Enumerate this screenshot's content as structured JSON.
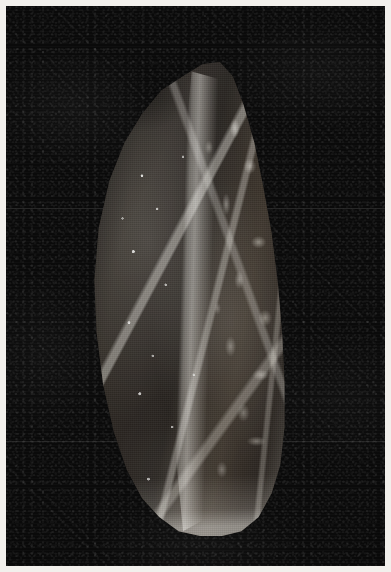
{
  "plate": {
    "name": "photographic-plate",
    "width": 391,
    "height": 572,
    "border_color": "#f2f0ec",
    "border_width_px": 6,
    "caption": "",
    "label": ""
  },
  "photo": {
    "name": "monochrome-photograph",
    "subject": "flint-hand-axe",
    "background_color": "#0a0a0a",
    "tone": "monochrome",
    "medium": "black-and-white-photographic-print",
    "grain": "visible-film-grain",
    "lighting": "raking-light-from-upper-left",
    "scan_seams": [
      {
        "name": "scan-seam-upper",
        "y": 208
      },
      {
        "name": "scan-seam-lower",
        "y": 441
      }
    ]
  },
  "artifact": {
    "name": "flint-biface-hand-axe",
    "shape": "leaf-shaped-teardrop",
    "tip": {
      "label": "pointed-apex",
      "x": 215,
      "y": 62
    },
    "base": {
      "label": "rounded-butt",
      "y": 525
    },
    "bounds": {
      "left": 75,
      "top": 58,
      "right": 285,
      "bottom": 528
    },
    "features": [
      {
        "name": "central-ridge",
        "description": "vertical median ridge with specular highlights"
      },
      {
        "name": "left-rim-highlight",
        "description": "bright contour along left edge"
      },
      {
        "name": "right-flake-scars",
        "description": "textured conchoidal flake scars on right face"
      },
      {
        "name": "dark-top-left-facet",
        "description": "shadowed struck facet near the tip"
      },
      {
        "name": "mineral-speckles",
        "description": "scattered white cortex inclusions"
      },
      {
        "name": "base-rim-highlight",
        "description": "bright rim along the rounded butt"
      }
    ],
    "stone_colors": {
      "darkest": "#141210",
      "mid": "#2a2521",
      "lightest": "#3b332a",
      "highlight": "#fffcf3"
    }
  }
}
